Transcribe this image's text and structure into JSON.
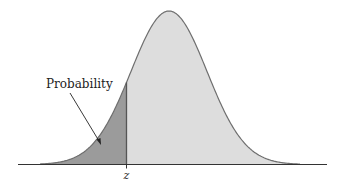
{
  "chart_data": {
    "type": "area",
    "title": "",
    "annotations": [
      {
        "text": "Probability",
        "points_to": "shaded left-tail area"
      }
    ],
    "x_tick_labels": [
      "z"
    ],
    "shaded_region": "left of z",
    "grid": false,
    "legend": null
  },
  "labels": {
    "probability": "Probability",
    "z": "z"
  },
  "colors": {
    "shaded": "#9b9b9b",
    "unshaded": "#dddddd",
    "outline": "#6e6e6e",
    "axis": "#333333"
  }
}
